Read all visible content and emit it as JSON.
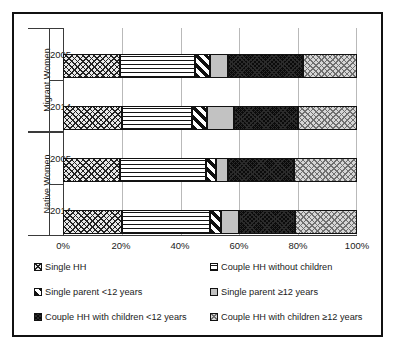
{
  "chart_data": {
    "type": "bar",
    "orientation": "horizontal",
    "stacked": true,
    "stacked_normalized": true,
    "title": "",
    "xlabel": "",
    "ylabel": "",
    "xlim": [
      0,
      100
    ],
    "xticks": [
      0,
      20,
      40,
      60,
      80,
      100
    ],
    "xtick_labels": [
      "0%",
      "20%",
      "40%",
      "60%",
      "80%",
      "100%"
    ],
    "grid": true,
    "grid_axis": "x",
    "legend_position": "bottom",
    "legend_columns": 2,
    "groups": [
      {
        "name": "Migrant Women",
        "categories": [
          "2005",
          "2014"
        ]
      },
      {
        "name": "Native Women",
        "categories": [
          "2005",
          "2014"
        ]
      }
    ],
    "categories": [
      "Migrant Women 2005",
      "Migrant Women 2014",
      "Native Women 2005",
      "Native Women 2014"
    ],
    "series": [
      {
        "name": "Single HH",
        "pattern": "diamond-grid",
        "values": [
          19.5,
          20.0,
          19.5,
          20.0
        ]
      },
      {
        "name": "Couple HH without  children",
        "pattern": "horizontal-lines",
        "values": [
          25.5,
          24.0,
          29.3,
          30.0
        ]
      },
      {
        "name": "Single parent <12 years",
        "pattern": "diagonal-stripes",
        "values": [
          5.0,
          5.0,
          3.2,
          3.6
        ]
      },
      {
        "name": "Single parent ≥12 years",
        "pattern": "solid-gray",
        "values": [
          6.0,
          9.0,
          4.0,
          6.4
        ]
      },
      {
        "name": "Couple HH with children <12 years",
        "pattern": "solid-black",
        "values": [
          25.5,
          22.0,
          22.5,
          19.0
        ]
      },
      {
        "name": "Couple HH with children ≥12 years",
        "pattern": "light-checker",
        "values": [
          18.5,
          20.0,
          21.5,
          21.0
        ]
      }
    ]
  },
  "axis": {
    "y_groups": [
      {
        "label": "Migrant Women",
        "ticks": [
          "2005",
          "2014"
        ]
      },
      {
        "label": "Native Women",
        "ticks": [
          "2005",
          "2014"
        ]
      }
    ],
    "x_tick_labels": [
      "0%",
      "20%",
      "40%",
      "60%",
      "80%",
      "100%"
    ]
  },
  "legend": {
    "items": [
      {
        "label": "Single HH"
      },
      {
        "label": "Couple HH without  children"
      },
      {
        "label": "Single parent <12 years"
      },
      {
        "label": "Single parent ≥12 years"
      },
      {
        "label": "Couple HH with children <12 years"
      },
      {
        "label": "Couple HH with children ≥12 years"
      }
    ]
  }
}
